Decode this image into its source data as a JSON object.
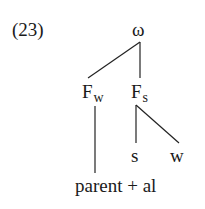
{
  "example_number": "(23)",
  "tree": {
    "root": {
      "label": "ω"
    },
    "foot_weak": {
      "base": "F",
      "subscript": "w"
    },
    "foot_strong": {
      "base": "F",
      "subscript": "s"
    },
    "syllable_strong": {
      "label": "s"
    },
    "syllable_weak": {
      "label": "w"
    },
    "terminal": {
      "label": "parent + al"
    }
  },
  "edges": [
    {
      "from": "ω",
      "to": "F_w"
    },
    {
      "from": "ω",
      "to": "F_s"
    },
    {
      "from": "F_w",
      "to": "parent + al"
    },
    {
      "from": "F_s",
      "to": "s"
    },
    {
      "from": "F_s",
      "to": "w"
    }
  ]
}
